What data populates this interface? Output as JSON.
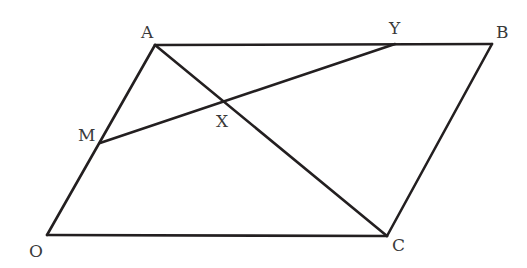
{
  "diagram": {
    "type": "geometry",
    "shape": "parallelogram",
    "stroke_color": "#231f20",
    "label_color": "#3a3a3a",
    "background": "#ffffff",
    "points": {
      "A": {
        "label": "A",
        "x": 155,
        "y": 45,
        "label_x": 141,
        "label_y": 38
      },
      "B": {
        "label": "B",
        "x": 492,
        "y": 44,
        "label_x": 496,
        "label_y": 38
      },
      "Y": {
        "label": "Y",
        "x": 395,
        "y": 44,
        "label_x": 389,
        "label_y": 34
      },
      "M": {
        "label": "M",
        "x": 100,
        "y": 143,
        "label_x": 78,
        "label_y": 141
      },
      "X": {
        "label": "X",
        "x": 225,
        "y": 102,
        "label_x": 216,
        "label_y": 127
      },
      "O": {
        "label": "O",
        "x": 47,
        "y": 235,
        "label_x": 29,
        "label_y": 257
      },
      "C": {
        "label": "C",
        "x": 387,
        "y": 236,
        "label_x": 392,
        "label_y": 251
      }
    },
    "segments": [
      {
        "name": "OA",
        "from": "O",
        "to": "A"
      },
      {
        "name": "AB",
        "from": "A",
        "to": "B"
      },
      {
        "name": "BC",
        "from": "B",
        "to": "C"
      },
      {
        "name": "CO",
        "from": "C",
        "to": "O"
      },
      {
        "name": "AC",
        "from": "A",
        "to": "C"
      },
      {
        "name": "MY",
        "from": "M",
        "to": "Y"
      }
    ]
  }
}
